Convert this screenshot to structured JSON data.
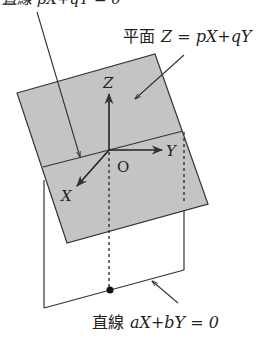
{
  "diagram": {
    "top_label_partial": "直線 pX+qY = 0",
    "plane_label_prefix": "平面",
    "plane_label_eq": "Z = pX+qY",
    "line_label_prefix": "直線",
    "line_label_eq": "aX+bY = 0",
    "axes": {
      "x": "X",
      "y": "Y",
      "z": "Z",
      "origin": "O"
    },
    "colors": {
      "plane_fill": "#c4c4c4",
      "stroke": "#333333",
      "background": "#ffffff"
    }
  }
}
